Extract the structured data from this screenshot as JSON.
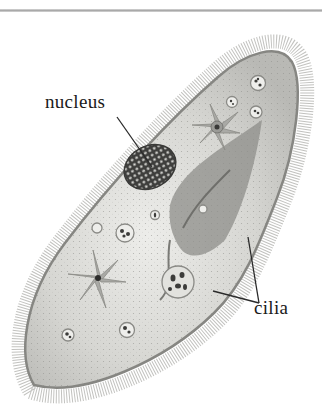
{
  "diagram": {
    "labels": [
      {
        "id": "nucleus",
        "text": "nucleus"
      },
      {
        "id": "cilia",
        "text": "cilia"
      }
    ],
    "colors": {
      "cytoplasm": "#d9d9d4",
      "membrane": "#8a8a86",
      "cilia": "#b5b5b2",
      "nucleus": "#4a4a48",
      "leader_line": "#2a2a2a",
      "rule": "#b0b0b0"
    }
  }
}
